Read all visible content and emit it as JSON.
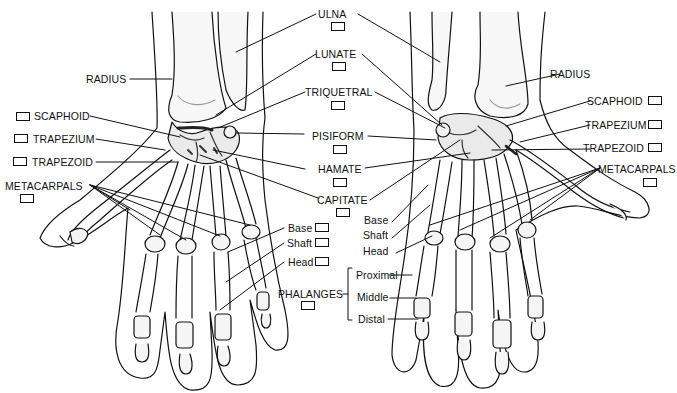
{
  "figure": {
    "views": [
      "Dorsal view (left)",
      "Palmar view (right)"
    ],
    "line_color": "#111111",
    "bone_fill": "#f4f4f4",
    "shade_color": "#9a9a9a"
  },
  "labels": {
    "center": {
      "ulna": "ULNA",
      "lunate": "LUNATE",
      "triquetral": "TRIQUETRAL",
      "pisiform": "PISIFORM",
      "hamate": "HAMATE",
      "capitate": "CAPITATE",
      "base": "Base",
      "shaft": "Shaft",
      "head": "Head",
      "phalanges": "PHALANGES"
    },
    "left": {
      "radius": "RADIUS",
      "scaphoid": "SCAPHOID",
      "trapezium": "TRAPEZIUM",
      "trapezoid": "TRAPEZOID",
      "metacarpals": "METACARPALS"
    },
    "right": {
      "radius": "RADIUS",
      "scaphoid": "SCAPHOID",
      "trapezium": "TRAPEZIUM",
      "trapezoid": "TRAPEZOID",
      "metacarpals": "METACARPALS",
      "base": "Base",
      "shaft": "Shaft",
      "head": "Head",
      "proximal": "Proximal",
      "middle": "Middle",
      "distal": "Distal"
    }
  },
  "answer_boxes": [
    {
      "id": "ulna",
      "value": ""
    },
    {
      "id": "lunate",
      "value": ""
    },
    {
      "id": "triquetral",
      "value": ""
    },
    {
      "id": "pisiform",
      "value": ""
    },
    {
      "id": "hamate",
      "value": ""
    },
    {
      "id": "capitate",
      "value": ""
    },
    {
      "id": "scaphoid-left",
      "value": ""
    },
    {
      "id": "trapezium-left",
      "value": ""
    },
    {
      "id": "trapezoid-left",
      "value": ""
    },
    {
      "id": "metacarpals-left",
      "value": ""
    },
    {
      "id": "base",
      "value": ""
    },
    {
      "id": "shaft",
      "value": ""
    },
    {
      "id": "head",
      "value": ""
    },
    {
      "id": "phalanges",
      "value": ""
    },
    {
      "id": "scaphoid-right",
      "value": ""
    },
    {
      "id": "trapezium-right",
      "value": ""
    },
    {
      "id": "trapezoid-right",
      "value": ""
    },
    {
      "id": "metacarpals-right",
      "value": ""
    }
  ]
}
